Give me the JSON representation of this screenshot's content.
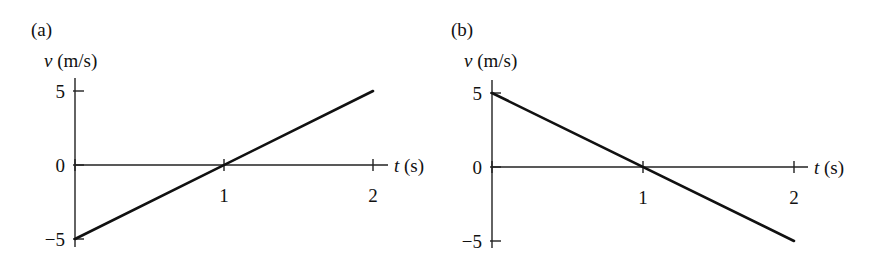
{
  "chart_data": [
    {
      "type": "line",
      "panel_label": "(a)",
      "ylabel_var": "v",
      "ylabel_unit": "(m/s)",
      "xlabel_var": "t",
      "xlabel_unit": "(s)",
      "xlim": [
        0,
        2.1
      ],
      "ylim": [
        -5,
        5
      ],
      "xticks": [
        1,
        2
      ],
      "xtick_labels": [
        "1",
        "2"
      ],
      "yticks": [
        5,
        0,
        -5
      ],
      "ytick_labels": [
        "5",
        "0",
        "−5"
      ],
      "grid": false,
      "series": [
        {
          "name": "v(t)",
          "x": [
            0,
            2
          ],
          "y": [
            -5,
            5
          ]
        }
      ]
    },
    {
      "type": "line",
      "panel_label": "(b)",
      "ylabel_var": "v",
      "ylabel_unit": "(m/s)",
      "xlabel_var": "t",
      "xlabel_unit": "(s)",
      "xlim": [
        0,
        2.1
      ],
      "ylim": [
        -5,
        5
      ],
      "xticks": [
        1,
        2
      ],
      "xtick_labels": [
        "1",
        "2"
      ],
      "yticks": [
        5,
        0,
        -5
      ],
      "ytick_labels": [
        "5",
        "0",
        "−5"
      ],
      "grid": false,
      "series": [
        {
          "name": "v(t)",
          "x": [
            0,
            2
          ],
          "y": [
            5,
            -5
          ]
        }
      ]
    }
  ]
}
